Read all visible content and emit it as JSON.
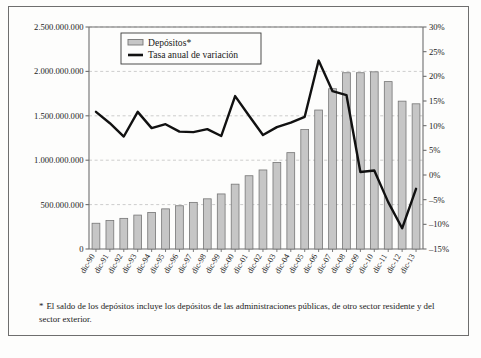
{
  "chart_data": {
    "type": "bar",
    "title": "",
    "xlabel": "",
    "ylabel": "",
    "grid": true,
    "legend_position": "top-left",
    "categories": [
      "dic-90",
      "dic-91",
      "dic-92",
      "dic-93",
      "dic-94",
      "dic-95",
      "dic-96",
      "dic-97",
      "dic-98",
      "dic-99",
      "dic-00",
      "dic-01",
      "dic-02",
      "dic-03",
      "dic-04",
      "dic-05",
      "dic-06",
      "dic-07",
      "dic-08",
      "dic-09",
      "dic-10",
      "dic-11",
      "dic-12",
      "dic-13"
    ],
    "series": [
      {
        "name": "Depósitos*",
        "type": "bar",
        "axis": "left",
        "unit": "euros",
        "color": "#c6c6c6",
        "border_color": "#767676",
        "values": [
          290000000,
          320000000,
          345000000,
          382000000,
          412000000,
          452000000,
          487000000,
          525000000,
          565000000,
          620000000,
          730000000,
          825000000,
          890000000,
          975000000,
          1085000000,
          1345000000,
          1565000000,
          1805000000,
          1985000000,
          1985000000,
          1995000000,
          1885000000,
          1665000000,
          1635000000
        ]
      },
      {
        "name": "Tasa anual de variación",
        "type": "line",
        "axis": "right",
        "unit": "%",
        "color": "#111111",
        "values": [
          12.8,
          10.5,
          7.8,
          12.8,
          9.5,
          10.3,
          8.8,
          8.7,
          9.3,
          7.9,
          16.0,
          12.0,
          8.1,
          9.7,
          10.6,
          11.8,
          23.2,
          17.0,
          16.2,
          0.6,
          0.9,
          -5.5,
          -10.8,
          -2.8
        ]
      }
    ],
    "y_left": {
      "min": 0,
      "max": 2500000000,
      "ticks": [
        0,
        500000000,
        1000000000,
        1500000000,
        2000000000,
        2500000000
      ],
      "tick_labels": [
        "0",
        "500.000.000",
        "1.000.000.000",
        "1.500.000.000",
        "2.000.000.000",
        "2.500.000.000"
      ]
    },
    "y_right": {
      "min": -15,
      "max": 30,
      "ticks": [
        -15,
        -10,
        -5,
        0,
        5,
        10,
        15,
        20,
        25,
        30
      ],
      "tick_labels": [
        "–15%",
        "–10%",
        "–5%",
        "0%",
        "5%",
        "10%",
        "15%",
        "20%",
        "25%",
        "30%"
      ]
    }
  },
  "legend": {
    "items": [
      {
        "label": "Depósitos*",
        "marker": "bar-swatch"
      },
      {
        "label": "Tasa anual de variación",
        "marker": "line-swatch"
      }
    ]
  },
  "footnote": {
    "marker": "*",
    "text": "El saldo de los depósitos incluye los depósitos de las administraciones públicas, de otro sector residente y del sector exterior."
  },
  "colors": {
    "bar_fill": "#c6c6c6",
    "bar_border": "#767676",
    "line": "#111111",
    "axis": "#6e6e6e",
    "grid": "#b9b9b9",
    "frame": "#6e6e6e",
    "background": "#fdfdfc"
  }
}
